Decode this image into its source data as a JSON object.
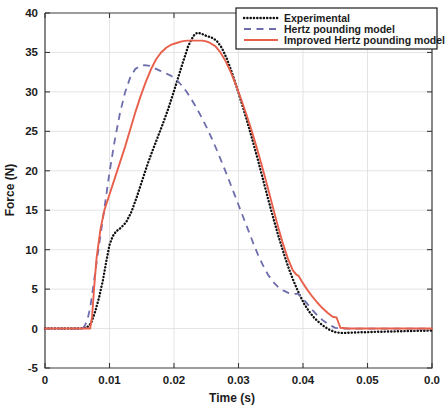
{
  "chart_data": {
    "type": "line",
    "title": "",
    "xlabel": "Time (s)",
    "ylabel": "Force (N)",
    "xlim": [
      0,
      0.06
    ],
    "ylim": [
      -5,
      40
    ],
    "xticks": [
      0,
      0.01,
      0.02,
      0.03,
      0.04,
      0.05,
      0.06
    ],
    "xtick_labels": [
      "0",
      "0.01",
      "0.02",
      "0.03",
      "0.04",
      "0.05",
      "0.0"
    ],
    "yticks": [
      -5,
      0,
      5,
      10,
      15,
      20,
      25,
      30,
      35,
      40
    ],
    "ytick_labels": [
      "-5",
      "0",
      "5",
      "10",
      "15",
      "20",
      "25",
      "30",
      "35",
      "40"
    ],
    "grid": true,
    "legend_position": "top-right",
    "series": [
      {
        "name": "Experimental",
        "style": "dotted",
        "color": "#111111",
        "x": [
          0,
          0.002,
          0.004,
          0.0055,
          0.0062,
          0.0068,
          0.0072,
          0.0078,
          0.0084,
          0.009,
          0.0095,
          0.01,
          0.0105,
          0.011,
          0.0118,
          0.0126,
          0.0134,
          0.0142,
          0.015,
          0.0158,
          0.0166,
          0.0174,
          0.0182,
          0.019,
          0.0198,
          0.0206,
          0.0214,
          0.0222,
          0.023,
          0.0236,
          0.0242,
          0.025,
          0.0258,
          0.0266,
          0.0274,
          0.0282,
          0.029,
          0.0298,
          0.0306,
          0.0314,
          0.0322,
          0.033,
          0.0338,
          0.0346,
          0.0354,
          0.0362,
          0.037,
          0.0378,
          0.0386,
          0.0394,
          0.0402,
          0.041,
          0.0418,
          0.0426,
          0.0434,
          0.0442,
          0.045,
          0.0458,
          0.0466,
          0.048,
          0.05,
          0.052,
          0.0545,
          0.057,
          0.06
        ],
        "y": [
          0,
          0,
          0,
          0,
          0.1,
          0.3,
          0.8,
          2.2,
          4.0,
          6.2,
          8.5,
          10.6,
          11.7,
          12.3,
          12.8,
          13.5,
          14.8,
          16.6,
          18.6,
          20.6,
          22.4,
          24.1,
          25.8,
          27.6,
          29.6,
          31.7,
          33.8,
          35.8,
          37.1,
          37.5,
          37.4,
          37.1,
          36.9,
          36.5,
          35.6,
          34.2,
          32.4,
          30.4,
          28.3,
          26.1,
          23.8,
          21.4,
          18.9,
          16.4,
          14.0,
          11.7,
          9.6,
          7.6,
          5.9,
          4.4,
          3.1,
          2.1,
          1.3,
          0.7,
          0.2,
          -0.2,
          -0.45,
          -0.55,
          -0.55,
          -0.5,
          -0.45,
          -0.4,
          -0.35,
          -0.3,
          -0.25
        ]
      },
      {
        "name": "Hertz pounding model",
        "style": "dashed",
        "color": "#6d6dad",
        "x": [
          0,
          0.002,
          0.004,
          0.0058,
          0.0062,
          0.0066,
          0.007,
          0.0075,
          0.008,
          0.0086,
          0.0092,
          0.01,
          0.0108,
          0.0116,
          0.0124,
          0.0132,
          0.014,
          0.0148,
          0.0155,
          0.0162,
          0.017,
          0.0178,
          0.0186,
          0.0194,
          0.0202,
          0.021,
          0.0218,
          0.0226,
          0.0234,
          0.0242,
          0.025,
          0.0258,
          0.0266,
          0.0274,
          0.0282,
          0.029,
          0.0298,
          0.0306,
          0.0314,
          0.0322,
          0.033,
          0.0338,
          0.0346,
          0.0354,
          0.0362,
          0.037,
          0.0378,
          0.0386,
          0.0392,
          0.0398,
          0.0406,
          0.0414,
          0.0422,
          0.043,
          0.044,
          0.045,
          0.0458,
          0.0466,
          0.05,
          0.06
        ],
        "y": [
          0,
          0,
          0,
          0,
          0.4,
          1.2,
          2.6,
          5.4,
          8.4,
          11.8,
          15.2,
          19.8,
          23.8,
          27.2,
          29.9,
          31.8,
          32.9,
          33.3,
          33.4,
          33.3,
          33.0,
          32.7,
          32.4,
          32.1,
          31.7,
          31.0,
          30.2,
          29.2,
          28.1,
          26.9,
          25.6,
          24.2,
          22.7,
          21.1,
          19.5,
          17.8,
          16.1,
          14.4,
          12.7,
          11.0,
          9.4,
          8.0,
          6.8,
          5.9,
          5.2,
          4.8,
          4.5,
          4.4,
          4.4,
          4.0,
          3.2,
          2.4,
          1.7,
          1.1,
          0.5,
          0.1,
          0,
          0,
          0,
          0
        ]
      },
      {
        "name": "Improved Hertz pounding model",
        "style": "solid",
        "color": "#e8604c",
        "x": [
          0,
          0.002,
          0.004,
          0.006,
          0.007,
          0.0073,
          0.0076,
          0.008,
          0.0086,
          0.0092,
          0.01,
          0.0108,
          0.0116,
          0.0124,
          0.0132,
          0.014,
          0.0148,
          0.0156,
          0.0164,
          0.0172,
          0.018,
          0.0188,
          0.0196,
          0.0204,
          0.0212,
          0.022,
          0.0228,
          0.0236,
          0.0244,
          0.025,
          0.0256,
          0.0264,
          0.0272,
          0.028,
          0.0288,
          0.0296,
          0.0304,
          0.0312,
          0.032,
          0.0328,
          0.0336,
          0.0344,
          0.0352,
          0.036,
          0.0368,
          0.0376,
          0.0384,
          0.039,
          0.0393,
          0.0398,
          0.0406,
          0.0414,
          0.0422,
          0.043,
          0.0438,
          0.0446,
          0.0452,
          0.0458,
          0.047,
          0.05,
          0.054,
          0.06
        ],
        "y": [
          0,
          0,
          0,
          0,
          0,
          1.5,
          5.0,
          9.0,
          12.6,
          15.0,
          17.0,
          19.0,
          21.0,
          23.0,
          25.2,
          27.4,
          29.4,
          31.2,
          32.8,
          34.1,
          35.0,
          35.6,
          36.0,
          36.2,
          36.4,
          36.5,
          36.5,
          36.5,
          36.5,
          36.4,
          36.2,
          35.8,
          35.0,
          33.9,
          32.5,
          30.9,
          29.1,
          27.2,
          25.2,
          23.0,
          20.7,
          18.3,
          15.8,
          13.3,
          11.0,
          9.0,
          7.4,
          6.8,
          6.7,
          6.0,
          5.0,
          4.1,
          3.3,
          2.6,
          2.0,
          1.5,
          1.4,
          0.1,
          0,
          0,
          0,
          0
        ]
      }
    ]
  },
  "legend": {
    "items": [
      {
        "label": "Experimental"
      },
      {
        "label": "Hertz pounding model"
      },
      {
        "label": "Improved Hertz pounding model"
      }
    ]
  }
}
